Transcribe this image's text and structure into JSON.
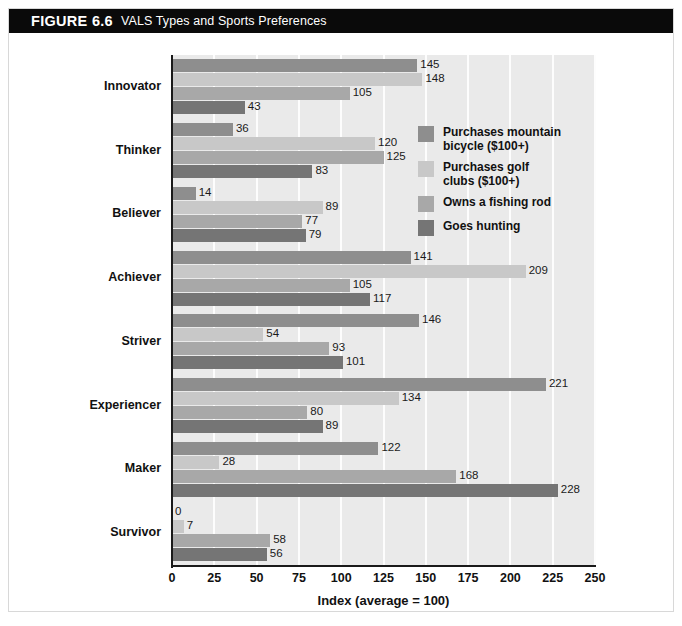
{
  "figure": {
    "number": "FIGURE 6.6",
    "title": "VALS Types and Sports Preferences"
  },
  "legend": {
    "items": [
      {
        "label": "Purchases mountain\nbicycle ($100+)",
        "color": "#8e8e8e",
        "icon": "legend-swatch-icon"
      },
      {
        "label": "Purchases golf\nclubs ($100+)",
        "color": "#c8c8c8",
        "icon": "legend-swatch-icon"
      },
      {
        "label": "Owns a fishing rod",
        "color": "#a8a8a8",
        "icon": "legend-swatch-icon"
      },
      {
        "label": "Goes hunting",
        "color": "#757575",
        "icon": "legend-swatch-icon"
      }
    ]
  },
  "axis": {
    "x_title": "Index (average = 100)",
    "x_ticks": [
      "0",
      "25",
      "50",
      "75",
      "100",
      "125",
      "150",
      "175",
      "200",
      "225",
      "250"
    ]
  },
  "chart_data": {
    "type": "bar",
    "orientation": "horizontal",
    "title": "VALS Types and Sports Preferences",
    "xlabel": "Index (average = 100)",
    "ylabel": "",
    "xlim": [
      0,
      250
    ],
    "xticks": [
      0,
      25,
      50,
      75,
      100,
      125,
      150,
      175,
      200,
      225,
      250
    ],
    "grid": "vertical-white-gridlines",
    "legend_position": "inside-right-upper",
    "categories": [
      "Innovator",
      "Thinker",
      "Believer",
      "Achiever",
      "Striver",
      "Experiencer",
      "Maker",
      "Survivor"
    ],
    "series": [
      {
        "name": "Purchases mountain bicycle ($100+)",
        "color": "#8e8e8e",
        "values": [
          145,
          36,
          14,
          141,
          146,
          221,
          122,
          0
        ]
      },
      {
        "name": "Purchases golf clubs ($100+)",
        "color": "#c8c8c8",
        "values": [
          148,
          120,
          89,
          209,
          54,
          134,
          28,
          7
        ]
      },
      {
        "name": "Owns a fishing rod",
        "color": "#a8a8a8",
        "values": [
          105,
          125,
          77,
          105,
          93,
          80,
          168,
          58
        ]
      },
      {
        "name": "Goes hunting",
        "color": "#757575",
        "values": [
          43,
          83,
          79,
          117,
          101,
          89,
          228,
          56
        ]
      }
    ]
  }
}
